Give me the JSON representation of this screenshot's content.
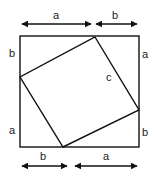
{
  "diagram": {
    "stroke_color": "#111111",
    "top_labels": [
      "a",
      "b"
    ],
    "bottom_labels": [
      "b",
      "a"
    ],
    "left_labels": [
      "b",
      "a"
    ],
    "right_labels": [
      "a",
      "b"
    ],
    "hypotenuse_label": "c"
  }
}
